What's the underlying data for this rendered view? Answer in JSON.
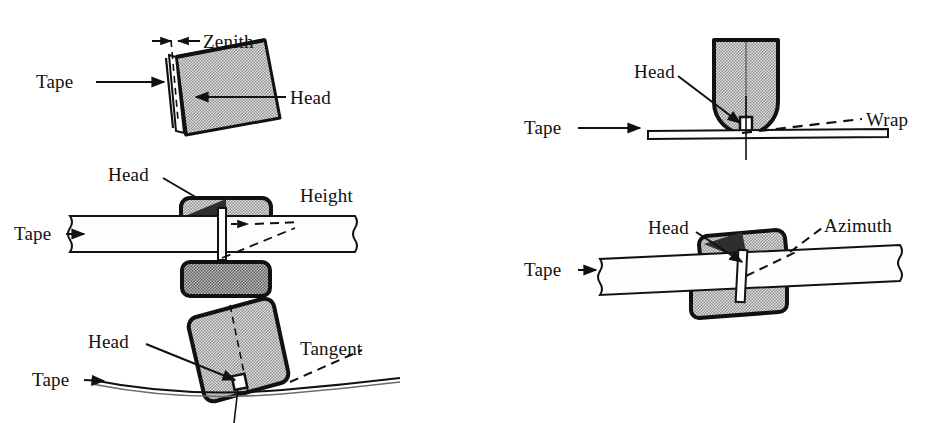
{
  "figure": {
    "background_color": "#ffffff",
    "ink_color": "#111111",
    "head_fill_color": "#c9c9c9",
    "head_outline_color": "#111111",
    "tape_fill_color": "#fdfdfd"
  },
  "diagrams": [
    {
      "id": "zenith",
      "parameter_label": "Zenith",
      "head_label": "Head",
      "tape_label": "Tape",
      "description": "Head tilted forward; gap between tape plane and head face measured at top",
      "column": "left",
      "order": 1
    },
    {
      "id": "height",
      "parameter_label": "Height",
      "head_label": "Head",
      "tape_label": "Tape",
      "description": "Vertical position of head gap relative to tape width",
      "column": "left",
      "order": 2
    },
    {
      "id": "tangent",
      "parameter_label": "Tangent",
      "head_label": "Head",
      "tape_label": "Tape",
      "description": "Head tilt relative to tangent of curved tape path",
      "column": "left",
      "order": 3
    },
    {
      "id": "wrap",
      "parameter_label": "Wrap",
      "head_label": "Head",
      "tape_label": "Tape",
      "description": "Angle of tape wrap around the head face",
      "column": "right",
      "order": 1
    },
    {
      "id": "azimuth",
      "parameter_label": "Azimuth",
      "head_label": "Head",
      "tape_label": "Tape",
      "description": "Rotation of head gap relative to perpendicular of tape travel",
      "column": "right",
      "order": 2
    }
  ]
}
